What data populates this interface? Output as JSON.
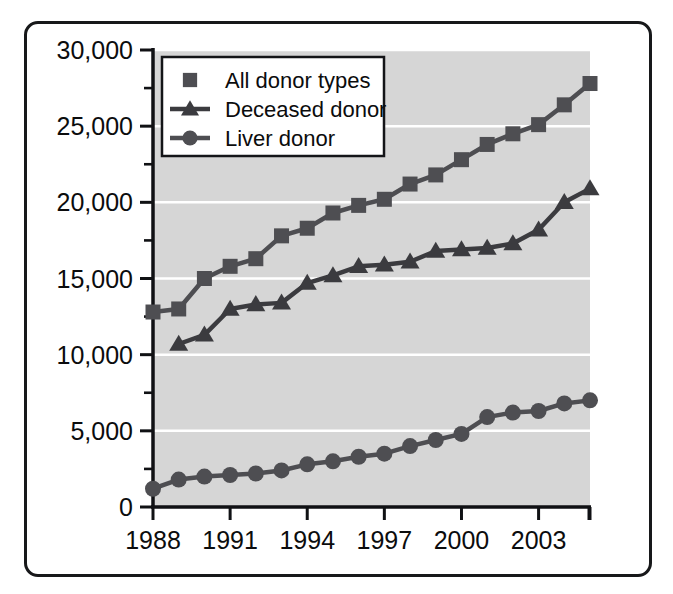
{
  "chart_data": {
    "type": "line",
    "title": "",
    "subtitle": "",
    "xlabel": "",
    "ylabel": "",
    "xlim": [
      1988,
      2005
    ],
    "ylim": [
      0,
      30000
    ],
    "grid": true,
    "grid_orientation": "horizontal",
    "legend_position": "top-left-inside",
    "x": [
      1988,
      1989,
      1990,
      1991,
      1992,
      1993,
      1994,
      1995,
      1996,
      1997,
      1998,
      1999,
      2000,
      2001,
      2002,
      2003,
      2004,
      2005
    ],
    "xticks": [
      1988,
      1991,
      1994,
      1997,
      2000,
      2003
    ],
    "xticklabels": [
      "1988",
      "1991",
      "1994",
      "1997",
      "2000",
      "2003"
    ],
    "xminorticks": [
      1988,
      1991,
      1994,
      1997,
      2000,
      2003,
      2005
    ],
    "yticks": [
      0,
      5000,
      10000,
      15000,
      20000,
      25000,
      30000
    ],
    "yticklabels": [
      "0",
      "5,000",
      "10,000",
      "15,000",
      "20,000",
      "25,000",
      "30,000"
    ],
    "yminorticks": [
      2500,
      7500,
      12500,
      17500,
      22500,
      27500
    ],
    "series": [
      {
        "name": "All donor types",
        "marker": "square",
        "color": "#4e4e52",
        "values": [
          12800,
          13000,
          15000,
          15800,
          16300,
          17800,
          18300,
          19300,
          19800,
          20200,
          21200,
          21800,
          22800,
          23800,
          24500,
          25100,
          26400,
          27800
        ]
      },
      {
        "name": "Deceased donor",
        "marker": "triangle",
        "color": "#3b3b3f",
        "values": [
          null,
          10700,
          11300,
          13000,
          13300,
          13400,
          14700,
          15200,
          15800,
          15900,
          16100,
          16800,
          16900,
          17000,
          17300,
          18200,
          20000,
          20900
        ]
      },
      {
        "name": "Liver donor",
        "marker": "circle",
        "color": "#4e4e52",
        "values": [
          1200,
          1800,
          2000,
          2100,
          2200,
          2400,
          2800,
          3000,
          3300,
          3500,
          4000,
          4400,
          4800,
          5900,
          6200,
          6300,
          6800,
          7000
        ]
      }
    ]
  },
  "legend": {
    "items": [
      {
        "label": "All donor types",
        "marker": "square"
      },
      {
        "label": "Deceased donor",
        "marker": "triangle"
      },
      {
        "label": "Liver donor",
        "marker": "circle"
      }
    ]
  },
  "axes": {
    "y_labels": [
      "30,000",
      "25,000",
      "20,000",
      "15,000",
      "10,000",
      "5,000",
      "0"
    ],
    "x_labels": [
      "1988",
      "1991",
      "1994",
      "1997",
      "2000",
      "2003"
    ]
  },
  "colors": {
    "plot_background": "#d6d6d6",
    "gridline": "#ffffff",
    "axis": "#101114",
    "marker": "#4a4a4e",
    "frame_border": "#17181a",
    "page_background": "#ffffff",
    "text": "#0b0c0d"
  }
}
